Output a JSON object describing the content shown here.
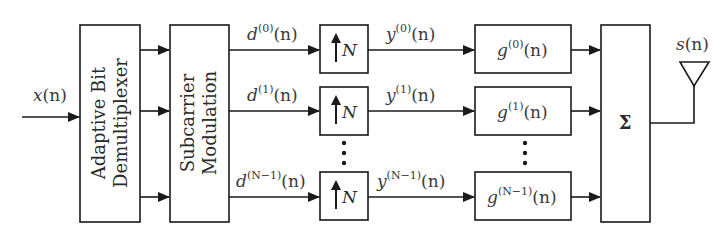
{
  "diagram": {
    "input": {
      "label_base": "x",
      "label_arg": "(n)"
    },
    "demux": {
      "line1": "Adaptive Bit",
      "line2": "Demultiplexer"
    },
    "modulation": {
      "line1": "Subcarrier",
      "line2": "Modulation"
    },
    "branches": [
      {
        "d_base": "d",
        "d_sup": "(0)",
        "d_arg": "(n)",
        "up_label": "N",
        "y_base": "y",
        "y_sup": "(0)",
        "y_arg": "(n)",
        "g_base": "g",
        "g_sup": "(0)",
        "g_arg": "(n)"
      },
      {
        "d_base": "d",
        "d_sup": "(1)",
        "d_arg": "(n)",
        "up_label": "N",
        "y_base": "y",
        "y_sup": "(1)",
        "y_arg": "(n)",
        "g_base": "g",
        "g_sup": "(1)",
        "g_arg": "(n)"
      },
      {
        "d_base": "d",
        "d_sup": "(N−1)",
        "d_arg": "(n)",
        "up_label": "N",
        "y_base": "y",
        "y_sup": "(N−1)",
        "y_arg": "(n)",
        "g_base": "g",
        "g_sup": "(N−1)",
        "g_arg": "(n)"
      }
    ],
    "summer": {
      "symbol": "Σ"
    },
    "output": {
      "label_base": "s",
      "label_arg": "(n)",
      "icon": "antenna-icon"
    },
    "colors": {
      "stroke": "#1a1a1a",
      "text": "#3a3a3a",
      "background": "#ffffff"
    }
  }
}
